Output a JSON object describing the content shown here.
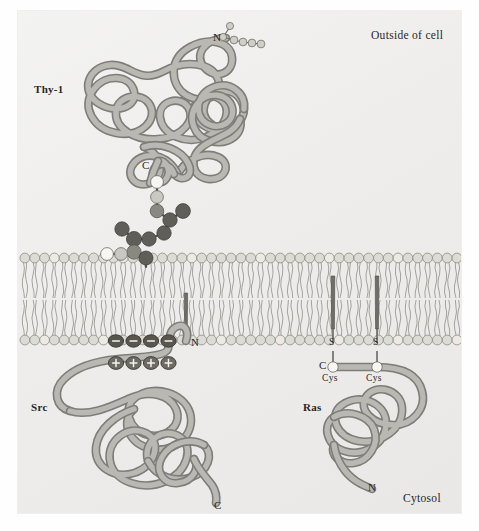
{
  "figure": {
    "background_color": "#eeedec",
    "ribbon_color": "#7e7d79",
    "membrane_head_color": "#dcdbd4"
  },
  "compartments": {
    "outside_label": "Outside of cell",
    "cytosol_label": "Cytosol"
  },
  "proteins": [
    {
      "name": "Thy-1",
      "label": "Thy-1",
      "anchor_type": "GPI anchor",
      "side": "outside",
      "n_terminus": "N",
      "c_terminus": "C",
      "glycan_spheres": 5
    },
    {
      "name": "Src",
      "label": "Src",
      "anchor_type": "myristoyl anchor plus basic residues",
      "side": "cytosol",
      "n_terminus": "N",
      "c_terminus": "C",
      "negative_charges": [
        "–",
        "–",
        "–",
        "–"
      ],
      "positive_charges": [
        "+",
        "+",
        "+",
        "+"
      ]
    },
    {
      "name": "Ras",
      "label": "Ras",
      "anchor_type": "prenyl / palmitoyl thioester anchors",
      "side": "cytosol",
      "n_terminus": "N",
      "c_terminus": "C",
      "sulfur_labels": [
        "S",
        "S"
      ],
      "cysteine_labels": [
        "Cys",
        "Cys"
      ]
    }
  ],
  "membrane": {
    "leaflets": 2,
    "headgroups_per_leaflet": 45
  }
}
